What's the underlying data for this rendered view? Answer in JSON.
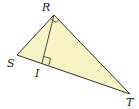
{
  "diagram": {
    "type": "geometry",
    "fill_color": "#f7f3c6",
    "stroke_color": "#333333",
    "vertices": {
      "R": {
        "label": "R",
        "x": 54,
        "y": 15
      },
      "S": {
        "label": "S",
        "x": 17,
        "y": 55
      },
      "T": {
        "label": "T",
        "x": 130,
        "y": 94
      },
      "I": {
        "label": "I",
        "x": 42,
        "y": 63
      }
    },
    "segments": [
      "RS",
      "RT",
      "ST",
      "RI"
    ],
    "right_angles": [
      "R",
      "I"
    ]
  }
}
